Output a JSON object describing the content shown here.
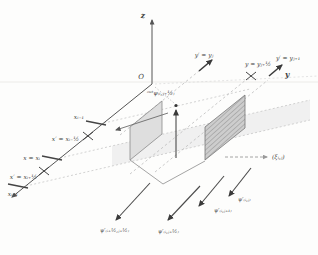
{
  "figure": {
    "type": "3d-mesh-cell-diagram",
    "background": "#fdfdfc",
    "colors": {
      "axis_line": "#555555",
      "dashed_grid": "#bcbcbc",
      "cell_band_fill": "#ececec",
      "wall_fill": "#dedede",
      "hatched_wall_fill": "#cdcdcd",
      "arrow_dark": "#3a3a3a",
      "text": "#3b3b3b"
    },
    "axes": {
      "z_label": "z",
      "y_label": "y",
      "origin_label": "O"
    },
    "x_axis_marks": [
      {
        "label": "xᵢ₋₁",
        "type": "tick"
      },
      {
        "label": "x′ = xᵢ₋½",
        "type": "cross-marker"
      },
      {
        "label": "x = xᵢ",
        "type": "tick"
      },
      {
        "label": "x′ = xᵢ₊½",
        "type": "cross-marker"
      },
      {
        "label": "xᵢ₊₁",
        "type": "tick"
      }
    ],
    "y_axis_marks": [
      {
        "label": "y′ = yⱼ",
        "type": "arrow"
      },
      {
        "label": "y = yⱼ₊½",
        "type": "cross-marker"
      },
      {
        "label": "y′ = yⱼ₊₁",
        "type": "arrow"
      }
    ],
    "cell_top_label": "ᵒᵘᵗψ₍ᵢ,ⱼ₊½₎",
    "ray_labels": [
      "ψ′₍ᵢ₊½,ⱼ₊½₎",
      "ψ′₍ᵢ,ⱼ₊½₎",
      "ψ′₍ᵢ,ⱼ₊₁₎",
      "ψ′₍ᵢ,ⱼ₎"
    ],
    "direction_label": "(ξᵢ,ⱼ)"
  }
}
